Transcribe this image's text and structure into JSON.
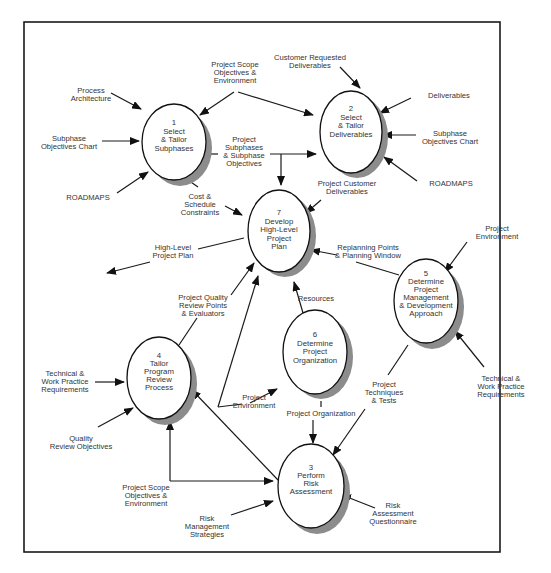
{
  "diagram": {
    "type": "data-flow-diagram",
    "processes": [
      {
        "id": "1",
        "lines": [
          "1",
          "Select",
          "& Tailor",
          "Subphases"
        ]
      },
      {
        "id": "2",
        "lines": [
          "2",
          "Select",
          "& Tailor",
          "Deliverables"
        ]
      },
      {
        "id": "3",
        "lines": [
          "3",
          "Perform",
          "Risk",
          "Assessment"
        ]
      },
      {
        "id": "4",
        "lines": [
          "4",
          "Tailor",
          "Program",
          "Review",
          "Process"
        ]
      },
      {
        "id": "5",
        "lines": [
          "5",
          "Determine",
          "Project",
          "Management",
          "& Development",
          "Approach"
        ]
      },
      {
        "id": "6",
        "lines": [
          "6",
          "Determine",
          "Project",
          "Organization"
        ]
      },
      {
        "id": "7",
        "lines": [
          "7",
          "Develop",
          "High-Level",
          "Project",
          "Plan"
        ]
      }
    ],
    "flows": [
      {
        "label": [
          "Process",
          "Architecture"
        ],
        "to": "1"
      },
      {
        "label": [
          "Subphase",
          "Objectives Chart"
        ],
        "to": "1"
      },
      {
        "label": [
          "ROADMAPS"
        ],
        "to": "1"
      },
      {
        "label": [
          "Project Scope",
          "Objectives &",
          "Environment"
        ],
        "to": [
          "1",
          "2"
        ]
      },
      {
        "label": [
          "Project",
          "Subphases",
          "& Subphase",
          "Objectives"
        ],
        "from": "1",
        "to": [
          "2",
          "7"
        ]
      },
      {
        "label": [
          "Cost &",
          "Schedule",
          "Constraints"
        ],
        "from": "1",
        "to": "7"
      },
      {
        "label": [
          "Customer Requested",
          "Deliverables"
        ],
        "to": "2"
      },
      {
        "label": [
          "Deliverables"
        ],
        "to": "2"
      },
      {
        "label": [
          "Subphase",
          "Objectives Chart"
        ],
        "to": "2"
      },
      {
        "label": [
          "ROADMAPS"
        ],
        "to": "2"
      },
      {
        "label": [
          "Project Customer",
          "Deliverables"
        ],
        "from": "2",
        "to": "7"
      },
      {
        "label": [
          "High-Level",
          "Project Plan"
        ],
        "from": "7"
      },
      {
        "label": [
          "Replanning Points",
          "& Planning Window"
        ],
        "from": "5",
        "to": "7"
      },
      {
        "label": [
          "Project",
          "Environment"
        ],
        "to": "5"
      },
      {
        "label": [
          "Technical &",
          "Work Practice",
          "Requirements"
        ],
        "to": "5"
      },
      {
        "label": [
          "Resources"
        ],
        "from": "6",
        "to": "7"
      },
      {
        "label": [
          "Project Quality",
          "Review Points",
          "& Evaluators"
        ],
        "from": "4",
        "to": "7"
      },
      {
        "label": [
          "Technical &",
          "Work Practice",
          "Requirements"
        ],
        "to": "4"
      },
      {
        "label": [
          "Quality",
          "Review Objectives"
        ],
        "to": "4"
      },
      {
        "label": [
          "Project",
          "Environment"
        ],
        "to": [
          "6",
          "7"
        ]
      },
      {
        "label": [
          "Project Organization"
        ],
        "from": "6",
        "to": "3"
      },
      {
        "label": [
          "Project",
          "Techniques",
          "& Tests"
        ],
        "from": "5",
        "to": "3"
      },
      {
        "label": [
          "Project Scope",
          "Objectives &",
          "Environment"
        ],
        "to": [
          "4",
          "3"
        ]
      },
      {
        "label": [
          "Risk",
          "Management",
          "Strategies"
        ],
        "to": "3"
      },
      {
        "label": [
          "Risk",
          "Assessment",
          "Questionnaire"
        ],
        "to": "3"
      }
    ]
  }
}
